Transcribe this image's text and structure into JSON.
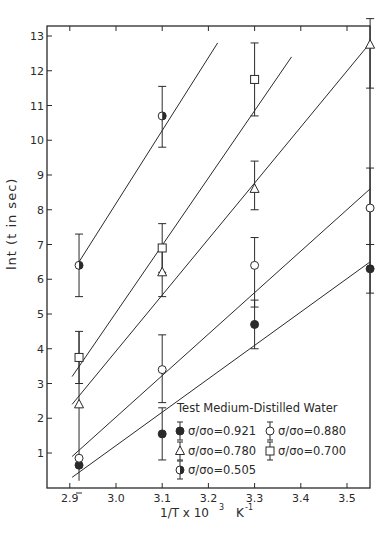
{
  "chart_data": {
    "type": "scatter",
    "title": "",
    "legend_title": "Test Medium-Distilled Water",
    "xlabel": "1/T x 10^3  K^-1",
    "xlabel_parts": {
      "main": "1/T x 10",
      "sup": "3",
      "unit": "K",
      "unit_sup": "-1"
    },
    "ylabel": "lnt (t in sec)",
    "xlim": [
      2.88,
      3.56
    ],
    "ylim": [
      0,
      13.3
    ],
    "x_ticks": [
      "2.9",
      "3.0",
      "3.1",
      "3.2",
      "3.3",
      "3.4",
      "3.5"
    ],
    "x_tick_values": [
      2.9,
      3.0,
      3.1,
      3.2,
      3.3,
      3.4,
      3.5
    ],
    "y_ticks": [
      "1",
      "2",
      "3",
      "4",
      "5",
      "6",
      "7",
      "8",
      "9",
      "10",
      "11",
      "12",
      "13"
    ],
    "y_tick_values": [
      1,
      2,
      3,
      4,
      5,
      6,
      7,
      8,
      9,
      10,
      11,
      12,
      13
    ],
    "grid": false,
    "legend_position": "lower right",
    "x": [
      2.92,
      3.1,
      3.3,
      3.55
    ],
    "series": [
      {
        "name": "σ/σo=0.921",
        "marker": "filled-circle",
        "values": [
          0.65,
          1.55,
          4.7,
          6.3
        ],
        "err_low": [
          null,
          0.8,
          4.0,
          5.6
        ],
        "err_high": [
          null,
          2.3,
          5.4,
          7.0
        ],
        "line": [
          [
            2.905,
            0.3
          ],
          [
            3.55,
            6.5
          ]
        ]
      },
      {
        "name": "σ/σo=0.880",
        "marker": "open-circle",
        "values": [
          0.85,
          3.4,
          6.4,
          8.05
        ],
        "err_low": [
          null,
          2.45,
          5.2,
          7.0
        ],
        "err_high": [
          null,
          4.4,
          7.2,
          9.2
        ],
        "line": [
          [
            2.905,
            0.9
          ],
          [
            3.55,
            8.6
          ]
        ]
      },
      {
        "name": "σ/σo=0.780",
        "marker": "triangle",
        "values": [
          2.4,
          6.2,
          8.6,
          12.75
        ],
        "err_low": [
          null,
          5.5,
          8.0,
          11.5
        ],
        "err_high": [
          null,
          7.0,
          9.4,
          13.5
        ],
        "line": [
          [
            2.905,
            2.4
          ],
          [
            3.55,
            12.8
          ]
        ]
      },
      {
        "name": "σ/σo=0.700",
        "marker": "square",
        "values": [
          3.75,
          6.9,
          11.75,
          null
        ],
        "err_low": [
          3.0,
          6.2,
          10.7,
          null
        ],
        "err_high": [
          4.5,
          7.6,
          12.8,
          null
        ],
        "line": [
          [
            2.905,
            3.2
          ],
          [
            3.38,
            12.4
          ]
        ]
      },
      {
        "name": "σ/σo=0.505",
        "marker": "half-filled-circle",
        "values": [
          6.4,
          10.7,
          null,
          null
        ],
        "err_low": [
          5.5,
          9.8,
          null,
          null
        ],
        "err_high": [
          7.3,
          11.55,
          null,
          null
        ],
        "line": [
          [
            2.92,
            6.5
          ],
          [
            3.22,
            12.8
          ]
        ]
      }
    ]
  },
  "labels": {
    "ylabel": "lnt  (t in sec)",
    "legend_title": "Test Medium-Distilled Water",
    "legend_0921": "σ/σo=0.921",
    "legend_0880": "σ/σo=0.880",
    "legend_0780": "σ/σo=0.780",
    "legend_0700": "σ/σo=0.700",
    "legend_0505": "σ/σo=0.505"
  }
}
